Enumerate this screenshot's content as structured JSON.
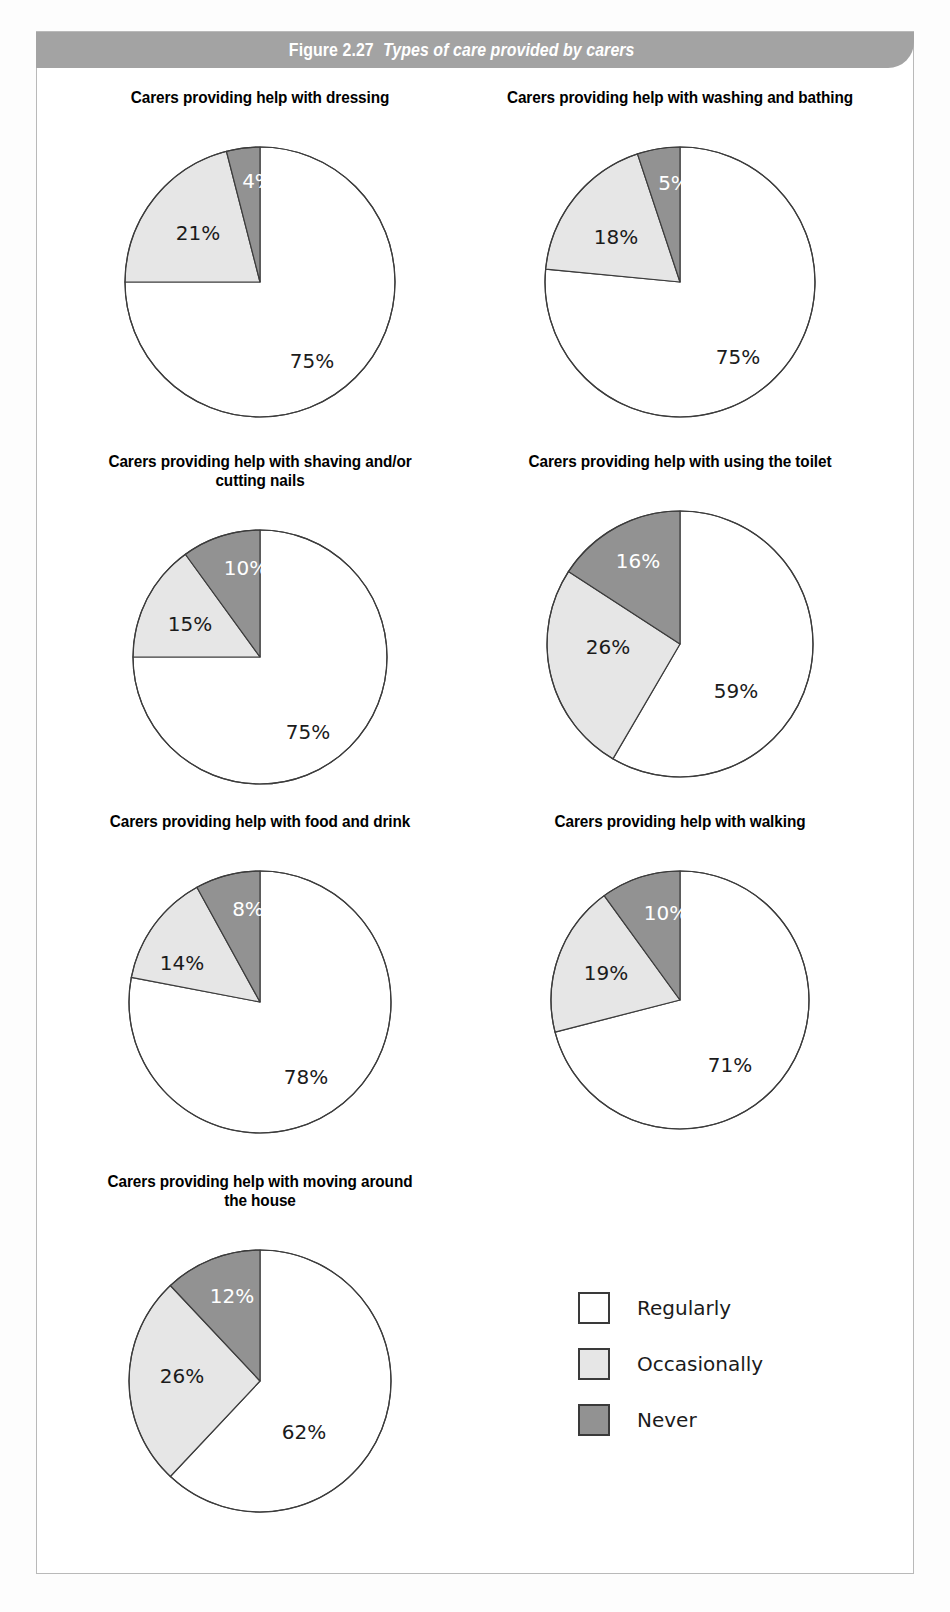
{
  "figure": {
    "number": "Figure 2.27",
    "title": "Types of care provided by carers"
  },
  "colors": {
    "regularly": "#ffffff",
    "occasionally": "#e6e6e6",
    "never": "#929292",
    "outline": "#3c3c3c",
    "banner_bg": "#a3a3a3",
    "banner_text": "#ffffff",
    "frame": "#b9b9b9"
  },
  "legend": {
    "items": [
      {
        "label": "Regularly",
        "color": "#ffffff"
      },
      {
        "label": "Occasionally",
        "color": "#e6e6e6"
      },
      {
        "label": "Never",
        "color": "#929292"
      }
    ]
  },
  "charts": [
    {
      "id": "dressing",
      "title": "Carers providing help with dressing",
      "labels": [
        "75%",
        "21%",
        "4%"
      ]
    },
    {
      "id": "washing-bathing",
      "title": "Carers providing help with washing and bathing",
      "labels": [
        "75%",
        "18%",
        "5%"
      ]
    },
    {
      "id": "shaving-nails",
      "title": "Carers providing help with shaving and/or\ncutting nails",
      "labels": [
        "75%",
        "15%",
        "10%"
      ]
    },
    {
      "id": "using-toilet",
      "title": "Carers providing help with using the toilet",
      "labels": [
        "59%",
        "26%",
        "16%"
      ]
    },
    {
      "id": "food-drink",
      "title": "Carers providing help with food and drink",
      "labels": [
        "78%",
        "14%",
        "8%"
      ]
    },
    {
      "id": "walking",
      "title": "Carers providing help with walking",
      "labels": [
        "71%",
        "19%",
        "10%"
      ]
    },
    {
      "id": "moving-around-house",
      "title": "Carers providing help with moving around\nthe house",
      "labels": [
        "62%",
        "26%",
        "12%"
      ]
    }
  ],
  "chart_data": {
    "type": "pie",
    "title": "Figure 2.27  Types of care provided by carers",
    "series_names": [
      "Regularly",
      "Occasionally",
      "Never"
    ],
    "legend_position": "bottom-right",
    "units": "percent",
    "start_angle_deg": 0,
    "direction": "clockwise",
    "charts": [
      {
        "title": "Carers providing help with dressing",
        "categories": [
          "Regularly",
          "Occasionally",
          "Never"
        ],
        "values": [
          75,
          21,
          4
        ]
      },
      {
        "title": "Carers providing help with washing and bathing",
        "categories": [
          "Regularly",
          "Occasionally",
          "Never"
        ],
        "values": [
          75,
          18,
          5
        ]
      },
      {
        "title": "Carers providing help with shaving and/or cutting nails",
        "categories": [
          "Regularly",
          "Occasionally",
          "Never"
        ],
        "values": [
          75,
          15,
          10
        ]
      },
      {
        "title": "Carers providing help with using the toilet",
        "categories": [
          "Regularly",
          "Occasionally",
          "Never"
        ],
        "values": [
          59,
          26,
          16
        ]
      },
      {
        "title": "Carers providing help with food and drink",
        "categories": [
          "Regularly",
          "Occasionally",
          "Never"
        ],
        "values": [
          78,
          14,
          8
        ]
      },
      {
        "title": "Carers providing help with walking",
        "categories": [
          "Regularly",
          "Occasionally",
          "Never"
        ],
        "values": [
          71,
          19,
          10
        ]
      },
      {
        "title": "Carers providing help with moving around the house",
        "categories": [
          "Regularly",
          "Occasionally",
          "Never"
        ],
        "values": [
          62,
          26,
          12
        ]
      }
    ]
  },
  "layout": {
    "panels": [
      {
        "chart": 0,
        "left": 50,
        "top": 88,
        "width": 420,
        "radius": 135,
        "title_width": 420,
        "label_pos": [
          [
            52,
            80
          ],
          [
            -62,
            -48
          ],
          [
            -2,
            -100
          ]
        ]
      },
      {
        "chart": 1,
        "left": 460,
        "top": 88,
        "width": 440,
        "radius": 135,
        "title_width": 440,
        "label_pos": [
          [
            58,
            76
          ],
          [
            -64,
            -44
          ],
          [
            -6,
            -98
          ]
        ]
      },
      {
        "chart": 2,
        "left": 50,
        "top": 452,
        "width": 420,
        "radius": 127,
        "title_width": 420,
        "label_pos": [
          [
            48,
            76
          ],
          [
            -70,
            -32
          ],
          [
            -14,
            -88
          ]
        ]
      },
      {
        "chart": 3,
        "left": 460,
        "top": 452,
        "width": 440,
        "radius": 133,
        "title_width": 440,
        "label_pos": [
          [
            56,
            48
          ],
          [
            -72,
            4
          ],
          [
            -42,
            -82
          ]
        ]
      },
      {
        "chart": 4,
        "left": 50,
        "top": 812,
        "width": 420,
        "radius": 131,
        "title_width": 420,
        "label_pos": [
          [
            46,
            76
          ],
          [
            -78,
            -38
          ],
          [
            -12,
            -92
          ]
        ]
      },
      {
        "chart": 5,
        "left": 460,
        "top": 812,
        "width": 440,
        "radius": 129,
        "title_width": 440,
        "label_pos": [
          [
            50,
            66
          ],
          [
            -74,
            -26
          ],
          [
            -14,
            -86
          ]
        ]
      },
      {
        "chart": 6,
        "left": 50,
        "top": 1172,
        "width": 420,
        "radius": 131,
        "title_width": 420,
        "label_pos": [
          [
            44,
            52
          ],
          [
            -78,
            -4
          ],
          [
            -28,
            -84
          ]
        ]
      }
    ]
  }
}
